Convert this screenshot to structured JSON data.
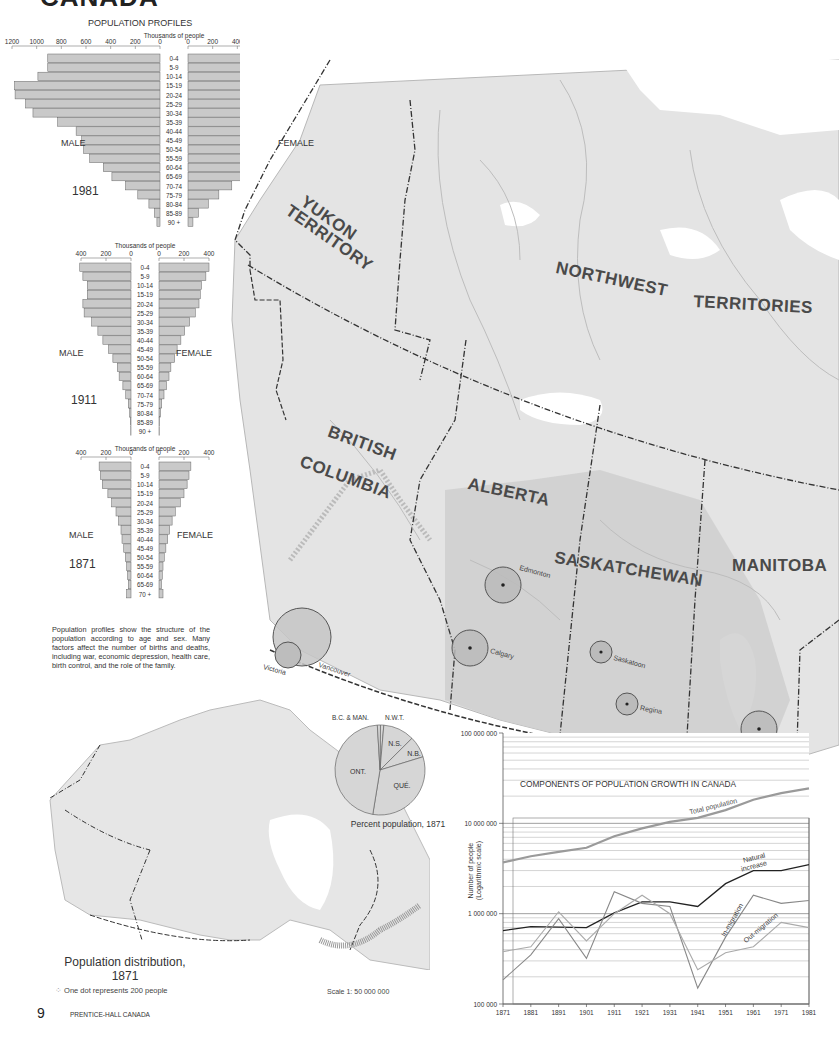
{
  "page": {
    "heading_partial": "CANADA",
    "page_number": "9",
    "publisher": "PRENTICE-HALL CANADA"
  },
  "population_profiles": {
    "title": "POPULATION PROFILES",
    "unit_label": "Thousands of people",
    "male_label": "MALE",
    "female_label": "FEMALE",
    "description": "Population profiles show the structure of the population according to age and sex. Many factors affect the number of births and deaths, including war, economic depression, health care, birth control, and the role of the family."
  },
  "map": {
    "regions": [
      "YUKON TERRITORY",
      "NORTHWEST TERRITORIES",
      "BRITISH COLUMBIA",
      "ALBERTA",
      "SASKATCHEWAN",
      "MANITOBA"
    ],
    "region_labels": {
      "yukon_1": "YUKON",
      "yukon_2": "TERRITORY",
      "nwt_1": "NORTHWEST",
      "nwt_2": "TERRITORIES",
      "bc_1": "BRITISH",
      "bc_2": "COLUMBIA",
      "alberta": "ALBERTA",
      "saskatchewan": "SASKATCHEWAN",
      "manitoba": "MANITOBA"
    },
    "cities": [
      "Victoria",
      "Vancouver",
      "Edmonton",
      "Calgary",
      "Saskatoon",
      "Regina",
      "Winnipeg"
    ],
    "inset": {
      "title": "Population distribution,",
      "year": "1871",
      "legend": "One dot represents 200 people",
      "scale": "Scale 1: 50 000 000"
    }
  },
  "chart_data": [
    {
      "type": "bar",
      "subtype": "population-pyramid",
      "title": "POPULATION PROFILES",
      "year": "1981",
      "xlabel": "Thousands of people",
      "xlim": [
        0,
        1200
      ],
      "ticks": [
        "1200",
        "1000",
        "800",
        "600",
        "400",
        "200",
        "0"
      ],
      "categories": [
        "0-4",
        "5-9",
        "10-14",
        "15-19",
        "20-24",
        "25-29",
        "30-34",
        "35-39",
        "40-44",
        "45-49",
        "50-54",
        "55-59",
        "60-64",
        "65-69",
        "70-74",
        "75-79",
        "80-84",
        "85-89",
        "90 +"
      ],
      "series": [
        {
          "name": "MALE",
          "values": [
            910,
            910,
            990,
            1180,
            1175,
            1090,
            1030,
            830,
            680,
            635,
            620,
            570,
            460,
            390,
            280,
            180,
            90,
            45,
            25
          ]
        },
        {
          "name": "FEMALE",
          "values": [
            870,
            860,
            940,
            1130,
            1165,
            1090,
            1020,
            810,
            660,
            620,
            620,
            610,
            520,
            460,
            355,
            250,
            165,
            85,
            40
          ]
        }
      ]
    },
    {
      "type": "bar",
      "subtype": "population-pyramid",
      "year": "1911",
      "xlabel": "Thousands of people",
      "xlim": [
        0,
        400
      ],
      "ticks": [
        "400",
        "200",
        "0"
      ],
      "categories": [
        "0-4",
        "5-9",
        "10-14",
        "15-19",
        "20-24",
        "25-29",
        "30-34",
        "35-39",
        "40-44",
        "45-49",
        "50-54",
        "55-59",
        "60-64",
        "65-69",
        "70-74",
        "75-79",
        "80-84",
        "85-89",
        "90 +"
      ],
      "series": [
        {
          "name": "MALE",
          "values": [
            410,
            385,
            350,
            350,
            385,
            375,
            315,
            265,
            225,
            180,
            145,
            110,
            95,
            65,
            42,
            22,
            11,
            5,
            2
          ]
        },
        {
          "name": "FEMALE",
          "values": [
            400,
            375,
            340,
            330,
            320,
            290,
            245,
            205,
            175,
            145,
            125,
            95,
            80,
            60,
            40,
            22,
            12,
            5,
            2
          ]
        }
      ]
    },
    {
      "type": "bar",
      "subtype": "population-pyramid",
      "year": "1871",
      "xlabel": "Thousands of people",
      "xlim": [
        0,
        400
      ],
      "ticks": [
        "400",
        "200",
        "0"
      ],
      "categories": [
        "0-4",
        "5-9",
        "10-14",
        "15-19",
        "20-24",
        "25-29",
        "30-34",
        "35-39",
        "40-44",
        "45-49",
        "50-54",
        "55-59",
        "60-64",
        "65-69",
        "70 +"
      ],
      "series": [
        {
          "name": "MALE",
          "values": [
            255,
            245,
            230,
            185,
            155,
            120,
            100,
            80,
            72,
            58,
            45,
            35,
            28,
            22,
            35
          ]
        },
        {
          "name": "FEMALE",
          "values": [
            255,
            240,
            225,
            200,
            170,
            130,
            105,
            85,
            70,
            55,
            42,
            32,
            26,
            20,
            32
          ]
        }
      ]
    },
    {
      "type": "pie",
      "title": "Percent population, 1871",
      "labels": [
        "ONT.",
        "QUÉ.",
        "N.B.",
        "N.S.",
        "N.W.T.",
        "B.C. & MAN."
      ],
      "values": [
        46.5,
        32.3,
        7.7,
        11.2,
        1.2,
        1.1
      ]
    },
    {
      "type": "line",
      "title": "COMPONENTS OF POPULATION GROWTH IN CANADA",
      "ylabel": "Number of people (Logarithmic scale)",
      "yscale": "log",
      "ylim": [
        100000,
        100000000
      ],
      "yticks": [
        "100 000 000",
        "10 000 000",
        "1 000 000",
        "100 000"
      ],
      "x": [
        1871,
        1881,
        1891,
        1901,
        1911,
        1921,
        1931,
        1941,
        1951,
        1961,
        1971,
        1981
      ],
      "series": [
        {
          "name": "Total population",
          "values": [
            3690000,
            4320000,
            4830000,
            5370000,
            7210000,
            8790000,
            10380000,
            11510000,
            14010000,
            18240000,
            21570000,
            24340000
          ]
        },
        {
          "name": "Natural increase",
          "values": [
            650000,
            720000,
            710000,
            700000,
            1020000,
            1350000,
            1350000,
            1200000,
            2150000,
            3000000,
            3000000,
            3500000
          ]
        },
        {
          "name": "In-migration",
          "values": [
            185000,
            350000,
            880000,
            320000,
            1750000,
            1300000,
            1200000,
            150000,
            550000,
            1600000,
            1300000,
            1400000
          ]
        },
        {
          "name": "Out-migration",
          "values": [
            380000,
            430000,
            1050000,
            500000,
            1000000,
            1600000,
            1000000,
            240000,
            370000,
            430000,
            800000,
            700000
          ]
        }
      ],
      "grid": true
    }
  ]
}
